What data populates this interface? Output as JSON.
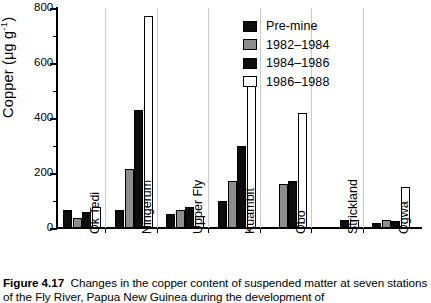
{
  "figure": {
    "caption_label": "Figure 4.17",
    "caption_text": "Changes in the copper content of suspended matter at seven stations of",
    "caption_text_line2": "the Fly River, Papua New Guinea during the development of"
  },
  "legend": {
    "position": "top-right",
    "entries": [
      {
        "label": "Pre-mine",
        "color": "#0d0d0d",
        "swatch": "filled-black"
      },
      {
        "label": "1982–1984",
        "color": "#8d8d8d",
        "swatch": "filled-gray"
      },
      {
        "label": "1984–1986",
        "color": "#0d0d0d",
        "swatch": "filled-black"
      },
      {
        "label": "1986–1988",
        "color": "#ffffff",
        "swatch": "open-white"
      }
    ]
  },
  "axes": {
    "y_title_main": "Copper",
    "y_title_units_open": "  (μg g",
    "y_title_units_exp": "-1",
    "y_title_units_close": ")",
    "y_ticks": [
      0,
      200,
      400,
      600,
      800
    ],
    "y_minor_ticks": [
      100,
      300,
      500,
      700
    ],
    "y_min": 0,
    "y_max": 800,
    "grid": false
  },
  "chart_data": {
    "type": "bar",
    "title": "",
    "xlabel": "",
    "ylabel": "Copper  (μg g-1)",
    "ylim": [
      0,
      800
    ],
    "grid": false,
    "legend_position": "top-right",
    "categories": [
      "Ok Tedi",
      "Ningerum",
      "Upper Fly",
      "Kuambit",
      "Obo",
      "Strickland",
      "Ogwa"
    ],
    "series": [
      {
        "name": "Pre-mine",
        "color": "#0d0d0d",
        "values": [
          65,
          65,
          50,
          100,
          null,
          null,
          20
        ]
      },
      {
        "name": "1982–1984",
        "color": "#8d8d8d",
        "values": [
          38,
          215,
          65,
          170,
          160,
          null,
          28
        ]
      },
      {
        "name": "1984–1986",
        "color": "#0d0d0d",
        "values": [
          60,
          430,
          78,
          300,
          170,
          30,
          25
        ]
      },
      {
        "name": "1986–1988",
        "color": "#ffffff",
        "values": [
          78,
          770,
          42,
          545,
          420,
          28,
          148
        ]
      }
    ]
  }
}
